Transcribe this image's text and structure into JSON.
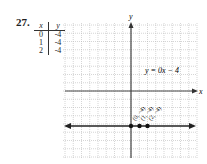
{
  "problem": {
    "number": "27."
  },
  "table": {
    "headers": [
      "x",
      "y"
    ],
    "rows": [
      [
        "0",
        "-4"
      ],
      [
        "1",
        "-4"
      ],
      [
        "2",
        "-4"
      ]
    ]
  },
  "graph": {
    "x_axis_label": "x",
    "y_axis_label": "y",
    "equation": "y = 0x − 4",
    "point_labels": [
      "(0, −4)",
      "(1, −4)",
      "(2, −4)"
    ]
  },
  "chart_data": {
    "type": "line",
    "title": "",
    "xlabel": "x",
    "ylabel": "y",
    "series": [
      {
        "name": "y = 0x − 4",
        "x": [
          0,
          1,
          2
        ],
        "y": [
          -4,
          -4,
          -4
        ]
      }
    ],
    "xlim": [
      -8,
      8
    ],
    "ylim": [
      -8,
      8
    ],
    "grid": true
  }
}
